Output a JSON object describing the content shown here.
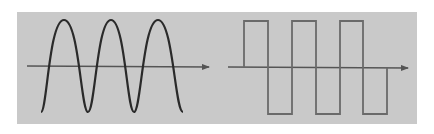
{
  "diagram": {
    "title": "",
    "panels": [
      {
        "id": "sine",
        "waveform": "sine-wave",
        "cycles": 3,
        "axis": "horizontal-arrow"
      },
      {
        "id": "square",
        "waveform": "square-wave",
        "cycles": 3,
        "axis": "horizontal-arrow"
      }
    ],
    "colors": {
      "background": "#ffffff",
      "panel": "#c9c9c9",
      "sine_stroke": "#2a2a2a",
      "square_stroke": "#6a6a6a",
      "axis": "#555555"
    }
  }
}
